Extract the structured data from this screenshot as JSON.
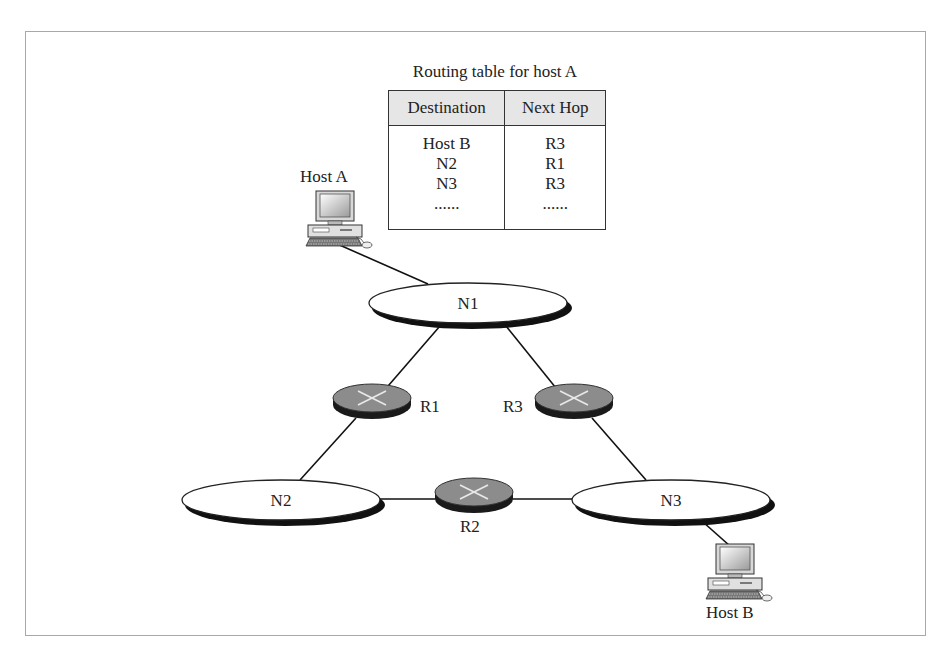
{
  "figure": {
    "caption_partial": "Figure ... example of routing"
  },
  "routing_table": {
    "title": "Routing table for host A",
    "headers": [
      "Destination",
      "Next Hop"
    ],
    "rows": [
      {
        "destination": "Host B",
        "next_hop": "R3"
      },
      {
        "destination": "N2",
        "next_hop": "R1"
      },
      {
        "destination": "N3",
        "next_hop": "R3"
      },
      {
        "destination": "......",
        "next_hop": "......"
      }
    ]
  },
  "hosts": [
    {
      "id": "host-a",
      "label": "Host A",
      "icon": "desktop-computer-icon"
    },
    {
      "id": "host-b",
      "label": "Host B",
      "icon": "desktop-computer-icon"
    }
  ],
  "networks": [
    {
      "id": "n1",
      "label": "N1"
    },
    {
      "id": "n2",
      "label": "N2"
    },
    {
      "id": "n3",
      "label": "N3"
    }
  ],
  "routers": [
    {
      "id": "r1",
      "label": "R1",
      "icon": "router-icon"
    },
    {
      "id": "r2",
      "label": "R2",
      "icon": "router-icon"
    },
    {
      "id": "r3",
      "label": "R3",
      "icon": "router-icon"
    }
  ],
  "links": [
    [
      "host-a",
      "n1"
    ],
    [
      "n1",
      "r1"
    ],
    [
      "n1",
      "r3"
    ],
    [
      "r1",
      "n2"
    ],
    [
      "r3",
      "n3"
    ],
    [
      "n2",
      "r2"
    ],
    [
      "r2",
      "n3"
    ],
    [
      "n3",
      "host-b"
    ]
  ],
  "colors": {
    "router_fill": "#8c8c8c",
    "router_base": "#1a1a1a",
    "table_header_bg": "#e6e6e6",
    "frame_border": "#a8a8a8",
    "line": "#111111"
  }
}
